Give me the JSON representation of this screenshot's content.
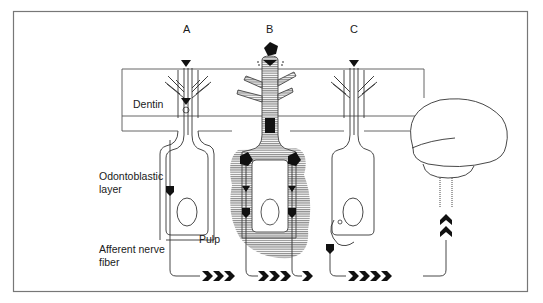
{
  "figure": {
    "type": "schematic diagram of dentin hypersensitivity / hydrodynamic mechanism",
    "columns": [
      {
        "id": "A",
        "label": "A"
      },
      {
        "id": "B",
        "label": "B"
      },
      {
        "id": "C",
        "label": "C"
      }
    ],
    "labels": {
      "dentin": "Dentin",
      "odontoblastic_line1": "Odontoblastic",
      "odontoblastic_line2": "layer",
      "afferent_line1": "Afferent nerve",
      "afferent_line2": "fiber",
      "pulp": "Pulp"
    },
    "colors": {
      "ink": "#1a1a1a",
      "frame": "#777777",
      "hatch": "#888888",
      "background": "#ffffff"
    }
  }
}
